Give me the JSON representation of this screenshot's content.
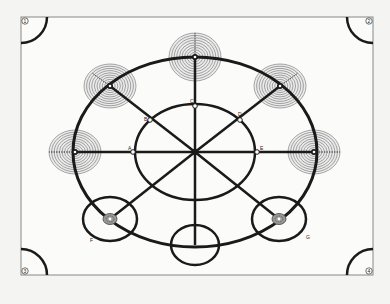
{
  "figure": {
    "type": "plan-diagram",
    "frame": {
      "x": 21,
      "y": 17,
      "width": 352,
      "height": 258,
      "color": "#888888"
    },
    "corner_markers": [
      {
        "id": "1",
        "label": "1",
        "corner": "top-left",
        "cx": 21,
        "cy": 17,
        "r": 26
      },
      {
        "id": "2",
        "label": "2",
        "corner": "top-right",
        "cx": 373,
        "cy": 17,
        "r": 26
      },
      {
        "id": "3",
        "label": "3",
        "corner": "bottom-left",
        "cx": 21,
        "cy": 275,
        "r": 26
      },
      {
        "id": "4",
        "label": "4",
        "corner": "bottom-right",
        "cx": 373,
        "cy": 275,
        "r": 26
      }
    ],
    "outer_circle": {
      "cx": 195,
      "cy": 152,
      "rx": 122,
      "ry": 95
    },
    "inner_circle": {
      "cx": 195,
      "cy": 152,
      "rx": 60,
      "ry": 48
    },
    "spokes_center": {
      "x": 195,
      "y": 152
    },
    "point_labels": [
      {
        "id": "A",
        "label": "A",
        "x": 133,
        "y": 152
      },
      {
        "id": "B",
        "label": "B",
        "x": 150,
        "y": 120
      },
      {
        "id": "C",
        "label": "C",
        "x": 195,
        "y": 106
      },
      {
        "id": "D",
        "label": "D",
        "x": 240,
        "y": 120
      },
      {
        "id": "E",
        "label": "E",
        "x": 257,
        "y": 152
      },
      {
        "id": "F",
        "label": "F",
        "x": 90,
        "y": 236
      },
      {
        "id": "G",
        "label": "G",
        "x": 302,
        "y": 234
      }
    ],
    "concentric_zones": [
      {
        "id": "top",
        "cx": 195,
        "cy": 57,
        "rx": 26,
        "ry": 24,
        "rings": 10
      },
      {
        "id": "upper-left",
        "cx": 110,
        "cy": 86,
        "rx": 26,
        "ry": 22,
        "rings": 10
      },
      {
        "id": "upper-right",
        "cx": 280,
        "cy": 86,
        "rx": 26,
        "ry": 22,
        "rings": 10
      },
      {
        "id": "left",
        "cx": 75,
        "cy": 152,
        "rx": 26,
        "ry": 22,
        "rings": 10
      },
      {
        "id": "right",
        "cx": 314,
        "cy": 152,
        "rx": 26,
        "ry": 22,
        "rings": 10
      }
    ],
    "small_circles": [
      {
        "id": "lower-left",
        "cx": 110,
        "cy": 219,
        "rx": 27,
        "ry": 22,
        "core": true
      },
      {
        "id": "lower-right",
        "cx": 279,
        "cy": 219,
        "rx": 27,
        "ry": 22,
        "core": true
      },
      {
        "id": "bottom",
        "cx": 195,
        "cy": 245,
        "rx": 24,
        "ry": 20,
        "core": false
      }
    ],
    "colors": {
      "stroke": "#1a1a1a",
      "ring": "#555555",
      "ring_fill": "#cfcfcf",
      "background": "#f4f4f2"
    }
  }
}
